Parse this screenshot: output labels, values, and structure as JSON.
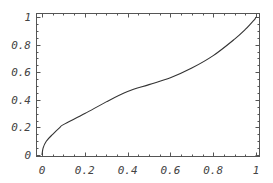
{
  "chart_data": {
    "type": "line",
    "title": "",
    "xlabel": "",
    "ylabel": "",
    "xlim": [
      0,
      1
    ],
    "ylim": [
      0,
      1
    ],
    "grid": false,
    "legend": null,
    "x_ticks": [
      "0",
      "0.2",
      "0.4",
      "0.6",
      "0.8",
      "1"
    ],
    "y_ticks": [
      "0",
      "0.2",
      "0.4",
      "0.6",
      "0.8",
      "1"
    ],
    "series": [
      {
        "name": "curve",
        "color": "#333333",
        "x": [
          0,
          0.005,
          0.02,
          0.05,
          0.084,
          0.1,
          0.2,
          0.3,
          0.4,
          0.5,
          0.6,
          0.7,
          0.8,
          0.9,
          0.95,
          0.98,
          0.995,
          1
        ],
        "y": [
          0,
          0.05,
          0.1,
          0.15,
          0.2,
          0.22,
          0.3,
          0.385,
          0.46,
          0.51,
          0.56,
          0.63,
          0.72,
          0.84,
          0.91,
          0.96,
          0.985,
          1
        ]
      }
    ]
  }
}
